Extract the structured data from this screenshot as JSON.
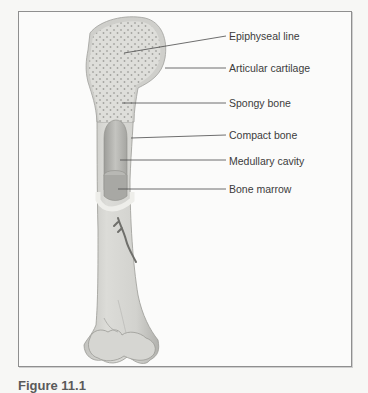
{
  "figure": {
    "caption": "Figure 11.1",
    "labels": [
      {
        "id": "epiphyseal-line",
        "text": "Epiphyseal line"
      },
      {
        "id": "articular-cartilage",
        "text": "Articular cartilage"
      },
      {
        "id": "spongy-bone",
        "text": "Spongy bone"
      },
      {
        "id": "compact-bone",
        "text": "Compact bone"
      },
      {
        "id": "medullary-cavity",
        "text": "Medullary cavity"
      },
      {
        "id": "bone-marrow",
        "text": "Bone marrow"
      }
    ],
    "colors": {
      "bone": "#d9d9d5",
      "bone_shade": "#bdbdb8",
      "cartilage": "#cfcfcb",
      "spongy_dots": "#9a9a96",
      "leader_line": "#4a4a4a",
      "frame_border": "#8f8f8f"
    }
  }
}
